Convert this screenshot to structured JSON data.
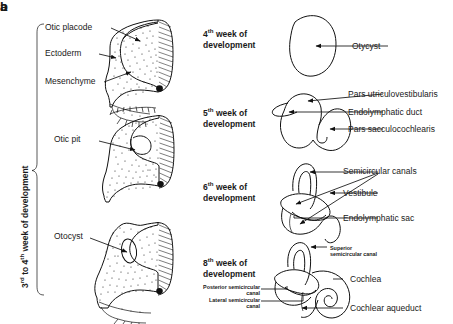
{
  "figure": {
    "panel_a": {
      "letter": "a",
      "axis_label": "3rd to 4th week of development",
      "axis_label_parts": {
        "pre": "3",
        "sup1": "rd",
        "mid": " to 4",
        "sup2": "th",
        "post": " week of development"
      },
      "labels": [
        {
          "name": "otic-placode",
          "text": "Otic placode"
        },
        {
          "name": "ectoderm",
          "text": "Ectoderm"
        },
        {
          "name": "mesenchyme",
          "text": "Mesenchyme"
        },
        {
          "name": "otic-pit",
          "text": "Otic pit"
        },
        {
          "name": "otocyst",
          "text": "Otocyst"
        }
      ],
      "stages": [
        {
          "name": "stage-otic-placode"
        },
        {
          "name": "stage-otic-pit"
        },
        {
          "name": "stage-otocyst"
        }
      ]
    },
    "panel_b": {
      "letter": "b",
      "stages": [
        {
          "name": "week-4",
          "stage_pre": "4",
          "stage_sup": "th",
          "stage_post": " week of",
          "stage_line2": "development",
          "labels": [
            {
              "name": "otocyst",
              "text": "Otycyst"
            }
          ]
        },
        {
          "name": "week-5",
          "stage_pre": "5",
          "stage_sup": "th",
          "stage_post": " week of",
          "stage_line2": "development",
          "labels": [
            {
              "name": "pars-utriculovestibularis",
              "text": "Pars utriculovestibularis"
            },
            {
              "name": "endolymphatic-duct",
              "text": "Endolymphatic duct"
            },
            {
              "name": "pars-sacculocochlearis",
              "text": "Pars sacculocochlearis"
            }
          ]
        },
        {
          "name": "week-6",
          "stage_pre": "6",
          "stage_sup": "th",
          "stage_post": " week of",
          "stage_line2": "development",
          "labels": [
            {
              "name": "semicircular-canals",
              "text": "Semicircular canals"
            },
            {
              "name": "vestibule",
              "text": "Vestibule"
            },
            {
              "name": "endolymphatic-sac",
              "text": "Endolymphatic sac"
            }
          ]
        },
        {
          "name": "week-8",
          "stage_pre": "8",
          "stage_sup": "th",
          "stage_post": " week of",
          "stage_line2": "development",
          "labels": [
            {
              "name": "superior-semicircular-canal-l1",
              "text": "Superior"
            },
            {
              "name": "superior-semicircular-canal-l2",
              "text": "semicircular canal"
            },
            {
              "name": "posterior-semicircular-canal-l1",
              "text": "Posterior semicircular"
            },
            {
              "name": "posterior-semicircular-canal-l2",
              "text": "canal"
            },
            {
              "name": "lateral-semicircular-canal-l1",
              "text": "Lateral semicircular"
            },
            {
              "name": "lateral-semicircular-canal-l2",
              "text": "canal"
            },
            {
              "name": "cochlea",
              "text": "Cochlea"
            },
            {
              "name": "cochlear-aqueduct",
              "text": "Cochlear aqueduct"
            }
          ]
        }
      ]
    }
  },
  "colors": {
    "ink": "#111111",
    "background": "#ffffff"
  }
}
